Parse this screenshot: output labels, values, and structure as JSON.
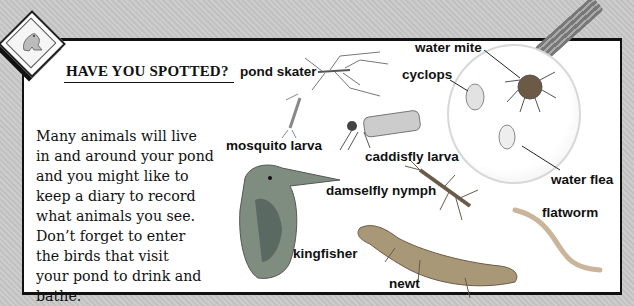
{
  "header": {
    "title": "HAVE YOU SPOTTED?",
    "badge_icon": "frog-icon"
  },
  "body": {
    "lines": [
      "Many animals will live",
      "in and around your pond",
      "and you might like to",
      "keep a diary to record",
      "what animals you see.",
      "Don’t forget to enter",
      "the birds that visit",
      "your pond to drink and",
      "bathe."
    ]
  },
  "labels": {
    "pond_skater": "pond skater",
    "water_mite": "water mite",
    "cyclops": "cyclops",
    "mosquito_larva": "mosquito larva",
    "caddisfly_larva": "caddisfly larva",
    "water_flea": "water flea",
    "damselfly_nymph": "damselfly nymph",
    "flatworm": "flatworm",
    "kingfisher": "kingfisher",
    "newt": "newt"
  }
}
